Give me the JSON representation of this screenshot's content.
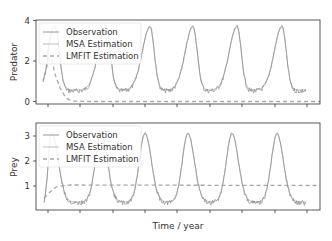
{
  "figure": {
    "xlabel": "Time / year",
    "colors": {
      "observation": "#8c8c8c",
      "msa": "#b0b0b0",
      "lmfit": "#a8a8a8",
      "frame": "#333333"
    }
  },
  "chart_data": [
    {
      "type": "line",
      "title": "",
      "xlabel": "",
      "ylabel": "Predator",
      "ylim": [
        -0.1,
        4.0
      ],
      "yticks": [
        0,
        2,
        4
      ],
      "xticks_labels_visible": false,
      "grid": false,
      "legend": {
        "position": "upper left",
        "entries": [
          "Observation",
          "MSA Estimation",
          "LMFIT Estimation"
        ]
      },
      "series": [
        {
          "name": "Observation",
          "style": "solid-noisy",
          "description": "periodic oscillation with sharp peaks ~3.6-3.7 and troughs ~0.3-0.5",
          "x": [
            0,
            0.5,
            1.0,
            1.5,
            2.0,
            2.5,
            3.0,
            3.5,
            4.0,
            4.5,
            5.0,
            5.5,
            6.0,
            6.5,
            7.0,
            7.5,
            8.0
          ],
          "values": [
            0.8,
            2.6,
            0.6,
            0.4,
            3.7,
            0.5,
            0.4,
            1.2,
            3.7,
            0.5,
            0.4,
            1.2,
            3.6,
            0.4,
            0.4,
            1.2,
            3.7
          ]
        },
        {
          "name": "MSA Estimation",
          "style": "solid",
          "description": "smooth curve tracking the observation peaks and troughs"
        },
        {
          "name": "LMFIT Estimation",
          "style": "dashed",
          "description": "rises to ~2 at start, then decays to ~0 and stays flat",
          "x": [
            0.0,
            0.2,
            0.4,
            0.8,
            1.5,
            8.0
          ],
          "values": [
            0.8,
            2.0,
            1.5,
            0.1,
            0.0,
            0.0
          ]
        }
      ]
    },
    {
      "type": "line",
      "title": "",
      "xlabel": "Time / year",
      "ylabel": "Prey",
      "ylim": [
        0.2,
        3.4
      ],
      "yticks": [
        1,
        2,
        3
      ],
      "xticks_labels_visible": false,
      "grid": false,
      "legend": {
        "position": "upper left",
        "entries": [
          "Observation",
          "MSA Estimation",
          "LMFIT Estimation"
        ]
      },
      "series": [
        {
          "name": "Observation",
          "style": "solid-noisy",
          "description": "periodic oscillation with peaks ~3.1-3.3 and troughs ~0.3-0.5",
          "x": [
            0,
            0.5,
            1.0,
            1.5,
            2.0,
            2.5,
            3.0,
            3.5,
            4.0,
            4.5,
            5.0,
            5.5,
            6.0,
            6.5,
            7.0,
            7.5,
            8.0
          ],
          "values": [
            0.4,
            2.6,
            0.5,
            0.35,
            3.2,
            0.4,
            0.35,
            1.5,
            3.0,
            0.4,
            0.35,
            1.5,
            3.2,
            0.4,
            0.3,
            1.2,
            0.5
          ]
        },
        {
          "name": "MSA Estimation",
          "style": "solid",
          "description": "smooth curve tracking the observation"
        },
        {
          "name": "LMFIT Estimation",
          "style": "dashed",
          "description": "rises from ~0.5 to ~1.1 early and stays near 1.1",
          "x": [
            0.0,
            0.4,
            0.8,
            1.2,
            8.0
          ],
          "values": [
            0.5,
            0.8,
            1.05,
            1.1,
            1.05
          ]
        }
      ]
    }
  ]
}
